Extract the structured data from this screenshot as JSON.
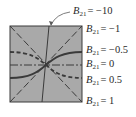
{
  "diagram": {
    "type": "parameter-curves",
    "colors": {
      "fill": "#a9a9a9",
      "border": "#3a3a3a",
      "lines": "#3a3a3a",
      "text": "#2a2a2a"
    },
    "labels": [
      {
        "var": "B",
        "sub": "21",
        "value": "= −10",
        "y": 14
      },
      {
        "var": "B",
        "sub": "21",
        "value": "= −1",
        "y": 32
      },
      {
        "var": "B",
        "sub": "21",
        "value": "= −0.5",
        "y": 53
      },
      {
        "var": "B",
        "sub": "21",
        "value": "= 0",
        "y": 67
      },
      {
        "var": "B",
        "sub": "21",
        "value": "= 0.5",
        "y": 83
      },
      {
        "var": "B",
        "sub": "21",
        "value": "= 1",
        "y": 104
      }
    ]
  }
}
